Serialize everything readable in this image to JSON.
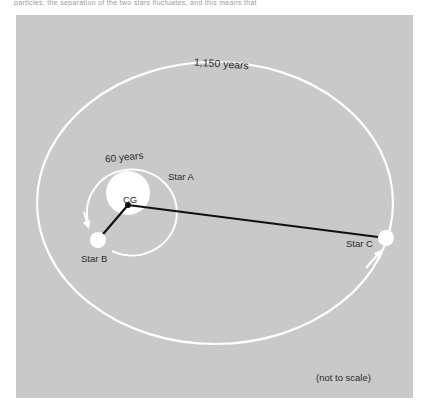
{
  "page": {
    "top_strip_text": "particles, the separation of the two stars fluctuates, and this means that"
  },
  "diagram": {
    "outer_orbit": {
      "label": "1,150 years",
      "center": [
        215,
        203
      ],
      "rx": 178,
      "ry": 141
    },
    "inner_orbit": {
      "label": "60 years",
      "center": [
        128,
        200
      ],
      "rx": 45,
      "ry": 43
    },
    "stars": [
      {
        "name": "Star A",
        "x": 128,
        "y": 193,
        "r": 22
      },
      {
        "name": "Star B",
        "x": 98,
        "y": 240,
        "r": 8
      },
      {
        "name": "Star C",
        "x": 386,
        "y": 238,
        "r": 8
      }
    ],
    "center_of_gravity": {
      "label": "CG",
      "x": 128,
      "y": 205
    },
    "note": "(not to scale)",
    "colors": {
      "background": "#c9c9c9",
      "orbit": "#ffffff",
      "star": "#ffffff",
      "line": "#111111",
      "text": "#2b2b2b"
    }
  }
}
